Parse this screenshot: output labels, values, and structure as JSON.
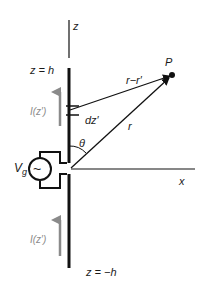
{
  "diagram": {
    "labels": {
      "z_axis": "z",
      "x_axis": "x",
      "top_end": "z = h",
      "bottom_end": "z = −h",
      "point": "P",
      "distance_from_element": "r−r′",
      "distance_from_origin": "r",
      "element": "dz′",
      "angle": "θ",
      "source": "V",
      "source_sub": "g",
      "source_symbol": "~",
      "current_top": "I(z′)",
      "current_bottom": "I(z′)"
    },
    "colors": {
      "line": "#111111",
      "current_arrow": "#8a8a8a",
      "current_label": "#8a8a8a"
    }
  }
}
